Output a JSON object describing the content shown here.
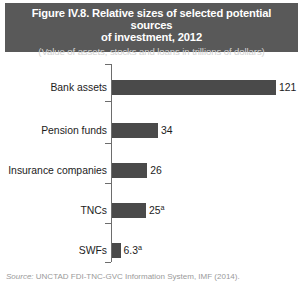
{
  "figure": {
    "title": "Figure IV.8. Relative sizes of selected potential sources of investment, 2012",
    "title_line_1": "Figure IV.8. Relative sizes of selected potential sources",
    "title_line_2": "of investment, 2012",
    "subtitle": "(Value of assets, stocks and loans in trillions of dollars)",
    "banner_color": "#595959",
    "banner_text_color": "#ffffff",
    "subtitle_text_color": "#d2d2d2"
  },
  "source": {
    "label": "Source:",
    "text": "UNCTAD FDI-TNC-GVC Information System, IMF (2014)."
  },
  "chart_data": {
    "type": "bar",
    "orientation": "horizontal",
    "title": "Figure IV.8. Relative sizes of selected potential sources of investment, 2012",
    "subtitle": "(Value of assets, stocks and loans in trillions of dollars)",
    "xlabel": "",
    "ylabel": "",
    "unit": "trillions of dollars",
    "grid": false,
    "legend": "none",
    "xlim": [
      0,
      132
    ],
    "bar_color": "#4a4a4a",
    "categories": [
      "Bank assets",
      "Pension funds",
      "Insurance companies",
      "TNCs",
      "SWFs"
    ],
    "values": [
      121,
      34,
      26,
      25,
      6.3
    ],
    "value_labels": [
      "121",
      "34",
      "26",
      "25",
      "6.3"
    ],
    "footnote_markers": [
      "",
      "",
      "",
      "a",
      "a"
    ],
    "bars": [
      {
        "category": "Bank assets",
        "value": 121,
        "label": "121",
        "footnote": ""
      },
      {
        "category": "Pension funds",
        "value": 34,
        "label": "34",
        "footnote": ""
      },
      {
        "category": "Insurance companies",
        "value": 26,
        "label": "26",
        "footnote": ""
      },
      {
        "category": "TNCs",
        "value": 25,
        "label": "25",
        "footnote": "a"
      },
      {
        "category": "SWFs",
        "value": 6.3,
        "label": "6.3",
        "footnote": "a"
      }
    ]
  }
}
